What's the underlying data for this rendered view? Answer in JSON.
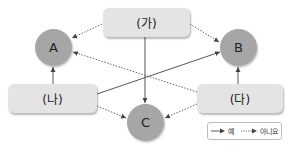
{
  "diagram": {
    "boxes": {
      "ga": {
        "label": "(가)"
      },
      "na": {
        "label": "(나)"
      },
      "da": {
        "label": "(다)"
      }
    },
    "nodes": {
      "a": {
        "label": "A"
      },
      "b": {
        "label": "B"
      },
      "c": {
        "label": "C"
      }
    },
    "edges": [
      {
        "from": "(가)",
        "to": "A",
        "style": "dotted",
        "meaning": "아니요"
      },
      {
        "from": "(가)",
        "to": "B",
        "style": "dotted",
        "meaning": "아니요"
      },
      {
        "from": "(가)",
        "to": "C",
        "style": "solid",
        "meaning": "예"
      },
      {
        "from": "(나)",
        "to": "A",
        "style": "solid",
        "meaning": "예"
      },
      {
        "from": "(나)",
        "to": "B",
        "style": "solid",
        "meaning": "예"
      },
      {
        "from": "(나)",
        "to": "C",
        "style": "dotted",
        "meaning": "아니요"
      },
      {
        "from": "(다)",
        "to": "B",
        "style": "solid",
        "meaning": "예"
      },
      {
        "from": "(다)",
        "to": "A",
        "style": "dotted",
        "meaning": "아니요"
      },
      {
        "from": "(다)",
        "to": "C",
        "style": "dotted",
        "meaning": "아니요"
      }
    ],
    "colors": {
      "box_fill": "#e4e4e4",
      "node_fill": "#a6a6a6",
      "edge": "#444444"
    }
  },
  "legend": {
    "yes_label": "예",
    "no_label": "아니요"
  }
}
